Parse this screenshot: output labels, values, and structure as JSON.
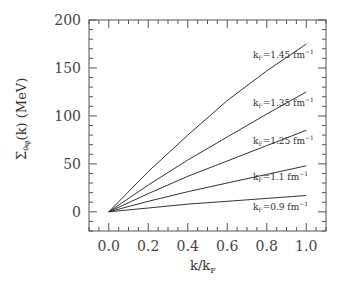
{
  "chart_data": {
    "type": "line",
    "title": "",
    "xlabel": "k/k_F",
    "ylabel": "Σ_θφ(k) (MeV)",
    "xlim": [
      -0.1,
      1.1
    ],
    "ylim": [
      -20,
      200
    ],
    "grid": false,
    "x_ticks": [
      "0.0",
      "0.2",
      "0.4",
      "0.6",
      "0.8",
      "1.0"
    ],
    "y_ticks": [
      "0",
      "50",
      "100",
      "150",
      "200"
    ],
    "x": [
      0.0,
      0.2,
      0.4,
      0.6,
      0.8,
      1.0
    ],
    "series": [
      {
        "name": "k_F=1.45 fm^-1",
        "values": [
          0,
          42,
          80,
          116,
          147,
          175
        ]
      },
      {
        "name": "k_F=1.35 fm^-1",
        "values": [
          0,
          28,
          54,
          78,
          102,
          125
        ]
      },
      {
        "name": "k_F=1.25 fm^-1",
        "values": [
          0,
          19,
          37,
          53,
          69,
          85
        ]
      },
      {
        "name": "k_F=1.1 fm^-1",
        "values": [
          0,
          11,
          21,
          30,
          39,
          48
        ]
      },
      {
        "name": "k_F=0.9 fm^-1",
        "values": [
          0,
          4,
          8,
          11,
          14,
          17
        ]
      }
    ],
    "legend": "inline labels near right end of each curve"
  },
  "labels": {
    "xaxis_main": "k/k",
    "xaxis_sub": "F",
    "yaxis_main": "Σ",
    "yaxis_sub": "θφ",
    "yaxis_rest": "(k)  (MeV)",
    "curves": [
      {
        "pre": "k",
        "sub": "F",
        "post": "=1.45 fm",
        "sup": "−1"
      },
      {
        "pre": "k",
        "sub": "F",
        "post": "=1.35 fm",
        "sup": "−1"
      },
      {
        "pre": "k",
        "sub": "F",
        "post": "=1.25 fm",
        "sup": "−1"
      },
      {
        "pre": "k",
        "sub": "F",
        "post": "=1.1 fm",
        "sup": "−1"
      },
      {
        "pre": "k",
        "sub": "F",
        "post": "=0.9 fm",
        "sup": "−1"
      }
    ]
  }
}
